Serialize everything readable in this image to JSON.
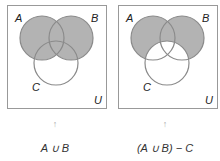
{
  "colors": {
    "fill": "#b3b3b3",
    "stroke": "#8a8a8a",
    "box": "#999999"
  },
  "panels": [
    {
      "set_labels": {
        "a": "A",
        "b": "B",
        "c": "C",
        "universe": "U"
      },
      "arrow": "↑",
      "caption": "A ∪ B",
      "shaded_region": "A ∪ B"
    },
    {
      "set_labels": {
        "a": "A",
        "b": "B",
        "c": "C",
        "universe": "U"
      },
      "arrow": "↑",
      "caption": "(A ∪ B) − C",
      "shaded_region": "(A ∪ B) − C"
    }
  ]
}
